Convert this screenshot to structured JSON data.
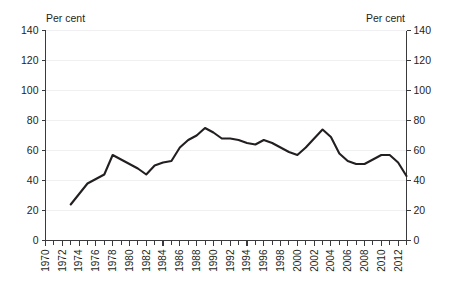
{
  "chart_data": {
    "type": "line",
    "title": "",
    "subtitle": "",
    "xlabel": "",
    "ylabel": "",
    "left_axis_unit": "Per cent",
    "right_axis_unit": "Per cent",
    "ylim": [
      0,
      140
    ],
    "y_ticks": [
      0,
      20,
      40,
      60,
      80,
      100,
      120,
      140
    ],
    "y_tick_labels": [
      "0",
      "20",
      "40",
      "60",
      "80",
      "100",
      "120",
      "140"
    ],
    "right_y_tick_labels": [
      "0",
      "20",
      "40",
      "60",
      "80",
      "100",
      "120",
      "140"
    ],
    "xlim": [
      1970,
      2013
    ],
    "x_ticks": [
      1970,
      1972,
      1974,
      1976,
      1978,
      1980,
      1982,
      1984,
      1986,
      1988,
      1990,
      1992,
      1994,
      1996,
      1998,
      2000,
      2002,
      2004,
      2006,
      2008,
      2010,
      2012
    ],
    "x_tick_labels": [
      "1970",
      "1972",
      "1974",
      "1976",
      "1978",
      "1980",
      "1982",
      "1984",
      "1986",
      "1988",
      "1990",
      "1992",
      "1994",
      "1996",
      "1998",
      "2000",
      "2002",
      "2004",
      "2006",
      "2008",
      "2010",
      "2012"
    ],
    "x_minor_tick_step": 1,
    "x_tick_label_rotation": -90,
    "grid": {
      "horizontal": true,
      "vertical": false,
      "color": "#f0f0f2"
    },
    "legend": {
      "visible": false,
      "position": "none",
      "entries": []
    },
    "line_color": "#231f20",
    "line_width": 2.1,
    "series": [
      {
        "name": "Per cent",
        "x": [
          1973,
          1974,
          1975,
          1976,
          1977,
          1978,
          1979,
          1980,
          1981,
          1982,
          1983,
          1984,
          1985,
          1986,
          1987,
          1988,
          1989,
          1990,
          1991,
          1992,
          1993,
          1994,
          1995,
          1996,
          1997,
          1998,
          1999,
          2000,
          2001,
          2002,
          2003,
          2004,
          2005,
          2006,
          2007,
          2008,
          2009,
          2010,
          2011,
          2012,
          2013
        ],
        "values": [
          24,
          31,
          38,
          41,
          44,
          57,
          54,
          51,
          48,
          44,
          50,
          52,
          53,
          62,
          67,
          70,
          75,
          72,
          68,
          68,
          67,
          65,
          64,
          67,
          65,
          62,
          59,
          57,
          62,
          68,
          74,
          69,
          58,
          53,
          51,
          51,
          54,
          57,
          57,
          52,
          43
        ],
        "note_x_semantics": "annual observations from 1973 to 2013"
      }
    ],
    "data_points": [
      {
        "year": 1973,
        "value": 24
      },
      {
        "year": 1974,
        "value": 31
      },
      {
        "year": 1975,
        "value": 38
      },
      {
        "year": 1976,
        "value": 41
      },
      {
        "year": 1977,
        "value": 44
      },
      {
        "year": 1978,
        "value": 57
      },
      {
        "year": 1979,
        "value": 54
      },
      {
        "year": 1980,
        "value": 51
      },
      {
        "year": 1981,
        "value": 48
      },
      {
        "year": 1982,
        "value": 44
      },
      {
        "year": 1983,
        "value": 50
      },
      {
        "year": 1984,
        "value": 52
      },
      {
        "year": 1985,
        "value": 53
      },
      {
        "year": 1986,
        "value": 62
      },
      {
        "year": 1987,
        "value": 67
      },
      {
        "year": 1988,
        "value": 70
      },
      {
        "year": 1989,
        "value": 75
      },
      {
        "year": 1990,
        "value": 72
      },
      {
        "year": 1991,
        "value": 68
      },
      {
        "year": 1992,
        "value": 68
      },
      {
        "year": 1993,
        "value": 67
      },
      {
        "year": 1994,
        "value": 65
      },
      {
        "year": 1995,
        "value": 64
      },
      {
        "year": 1996,
        "value": 67
      },
      {
        "year": 1997,
        "value": 65
      },
      {
        "year": 1998,
        "value": 62
      },
      {
        "year": 1999,
        "value": 59
      },
      {
        "year": 2000,
        "value": 57
      },
      {
        "year": 2001,
        "value": 62
      },
      {
        "year": 2002,
        "value": 68
      },
      {
        "year": 2003,
        "value": 74
      },
      {
        "year": 2004,
        "value": 69
      },
      {
        "year": 2005,
        "value": 58
      },
      {
        "year": 2006,
        "value": 53
      },
      {
        "year": 2007,
        "value": 51
      },
      {
        "year": 2008,
        "value": 51
      },
      {
        "year": 2009,
        "value": 54
      },
      {
        "year": 2010,
        "value": 57
      },
      {
        "year": 2011,
        "value": 57
      },
      {
        "year": 2012,
        "value": 52
      },
      {
        "year": 2013,
        "value": 43
      }
    ]
  }
}
